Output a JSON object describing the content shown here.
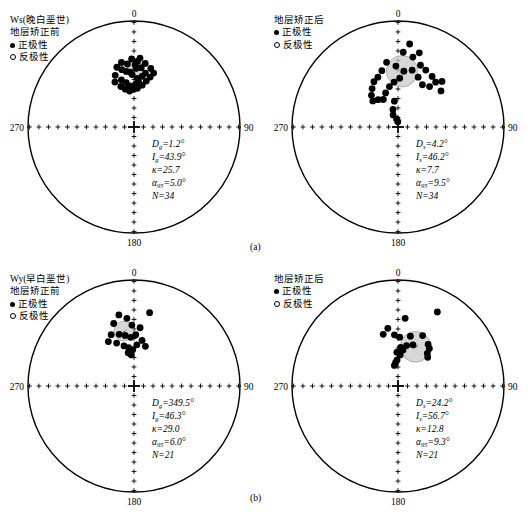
{
  "figure": {
    "subcaptions": [
      {
        "label": "(a)",
        "x": 250,
        "y": 242
      },
      {
        "label": "(b)",
        "x": 250,
        "y": 493
      }
    ]
  },
  "axis_labels": {
    "north": "0",
    "east": "90",
    "south": "180",
    "west": "270"
  },
  "legend_common": {
    "normal_label": "正极性",
    "reverse_label": "反极性",
    "normal_marker": "filled-circle-icon",
    "reverse_marker": "open-circle-icon"
  },
  "panels": [
    {
      "id": "ws-before",
      "title_lines": [
        "Ws(晚白垩世)",
        "地层矫正前"
      ],
      "stats": [
        {
          "sym": "D",
          "sub": "g",
          "val": "=1.2°"
        },
        {
          "sym": "I",
          "sub": "g",
          "val": "=43.9°"
        },
        {
          "sym": "κ",
          "sub": "",
          "val": "=25.7"
        },
        {
          "sym": "α",
          "sub": "95",
          "val": "=5.0°"
        },
        {
          "sym": "N",
          "sub": "",
          "val": "=34"
        }
      ],
      "mean": {
        "dec": 1.2,
        "inc": 43.9,
        "a95": 5.0
      },
      "n": 34,
      "points": [
        [
          356,
          47
        ],
        [
          2,
          44
        ],
        [
          358,
          49
        ],
        [
          4,
          52
        ],
        [
          1,
          41
        ],
        [
          352,
          46
        ],
        [
          348,
          44
        ],
        [
          345,
          52
        ],
        [
          350,
          55
        ],
        [
          354,
          58
        ],
        [
          2,
          57
        ],
        [
          6,
          55
        ],
        [
          9,
          50
        ],
        [
          12,
          47
        ],
        [
          7,
          43
        ],
        [
          3,
          38
        ],
        [
          358,
          36
        ],
        [
          354,
          40
        ],
        [
          349,
          38
        ],
        [
          344,
          41
        ],
        [
          340,
          47
        ],
        [
          337,
          52
        ],
        [
          342,
          57
        ],
        [
          347,
          60
        ],
        [
          353,
          62
        ],
        [
          359,
          61
        ],
        [
          5,
          60
        ],
        [
          11,
          57
        ],
        [
          15,
          53
        ],
        [
          18,
          49
        ],
        [
          20,
          45
        ],
        [
          16,
          42
        ],
        [
          10,
          39
        ],
        [
          5,
          35
        ]
      ]
    },
    {
      "id": "ws-after",
      "title_lines": [
        "地层矫正后"
      ],
      "stats": [
        {
          "sym": "D",
          "sub": "s",
          "val": "=4.2°"
        },
        {
          "sym": "I",
          "sub": "s",
          "val": "=46.2°"
        },
        {
          "sym": "κ",
          "sub": "",
          "val": "=7.7"
        },
        {
          "sym": "α",
          "sub": "95",
          "val": "=9.5°"
        },
        {
          "sym": "N",
          "sub": "",
          "val": "=34"
        }
      ],
      "mean": {
        "dec": 4.2,
        "inc": 46.2,
        "a95": 9.5
      },
      "n": 34,
      "points": [
        [
          8,
          22
        ],
        [
          4,
          30
        ],
        [
          12,
          33
        ],
        [
          16,
          28
        ],
        [
          20,
          38
        ],
        [
          26,
          40
        ],
        [
          34,
          42
        ],
        [
          40,
          44
        ],
        [
          44,
          40
        ],
        [
          50,
          46
        ],
        [
          38,
          50
        ],
        [
          30,
          52
        ],
        [
          22,
          48
        ],
        [
          14,
          44
        ],
        [
          6,
          46
        ],
        [
          358,
          42
        ],
        [
          350,
          38
        ],
        [
          344,
          44
        ],
        [
          338,
          48
        ],
        [
          332,
          50
        ],
        [
          326,
          54
        ],
        [
          320,
          58
        ],
        [
          316,
          62
        ],
        [
          324,
          64
        ],
        [
          332,
          66
        ],
        [
          340,
          62
        ],
        [
          348,
          58
        ],
        [
          355,
          55
        ],
        [
          2,
          52
        ],
        [
          352,
          70
        ],
        [
          344,
          76
        ],
        [
          338,
          80
        ],
        [
          350,
          84
        ],
        [
          358,
          86
        ]
      ]
    },
    {
      "id": "wy-before",
      "title_lines": [
        "Wy(早白垩世)",
        "地层矫正前"
      ],
      "stats": [
        {
          "sym": "D",
          "sub": "g",
          "val": "=349.5°"
        },
        {
          "sym": "I",
          "sub": "g",
          "val": "=46.3°"
        },
        {
          "sym": "κ",
          "sub": "",
          "val": "=29.0"
        },
        {
          "sym": "α",
          "sub": "95",
          "val": "=6.0°"
        },
        {
          "sym": "N",
          "sub": "",
          "val": "=21"
        }
      ],
      "mean": {
        "dec": 349.5,
        "inc": 46.3,
        "a95": 6.0
      },
      "n": 21,
      "points": [
        [
          348,
          32
        ],
        [
          12,
          30
        ],
        [
          342,
          38
        ],
        [
          354,
          36
        ],
        [
          358,
          42
        ],
        [
          6,
          44
        ],
        [
          336,
          46
        ],
        [
          330,
          50
        ],
        [
          344,
          48
        ],
        [
          350,
          50
        ],
        [
          356,
          52
        ],
        [
          2,
          50
        ],
        [
          338,
          54
        ],
        [
          346,
          58
        ],
        [
          352,
          60
        ],
        [
          358,
          62
        ],
        [
          4,
          58
        ],
        [
          10,
          54
        ],
        [
          16,
          58
        ],
        [
          350,
          64
        ],
        [
          355,
          66
        ]
      ]
    },
    {
      "id": "wy-after",
      "title_lines": [
        "地层矫正后"
      ],
      "stats": [
        {
          "sym": "D",
          "sub": "s",
          "val": "=24.2°"
        },
        {
          "sym": "I",
          "sub": "s",
          "val": "=56.7°"
        },
        {
          "sym": "κ",
          "sub": "",
          "val": "=12.8"
        },
        {
          "sym": "α",
          "sub": "95",
          "val": "=9.3°"
        },
        {
          "sym": "N",
          "sub": "",
          "val": "=21"
        }
      ],
      "mean": {
        "dec": 24.2,
        "inc": 56.7,
        "a95": 9.3
      },
      "n": 21,
      "points": [
        [
          28,
          22
        ],
        [
          6,
          36
        ],
        [
          350,
          44
        ],
        [
          344,
          48
        ],
        [
          356,
          50
        ],
        [
          2,
          52
        ],
        [
          14,
          50
        ],
        [
          26,
          46
        ],
        [
          36,
          50
        ],
        [
          40,
          52
        ],
        [
          42,
          56
        ],
        [
          46,
          58
        ],
        [
          20,
          56
        ],
        [
          12,
          58
        ],
        [
          8,
          62
        ],
        [
          4,
          66
        ],
        [
          358,
          70
        ],
        [
          354,
          72
        ],
        [
          350,
          74
        ],
        [
          4,
          60
        ],
        [
          358,
          64
        ]
      ]
    }
  ]
}
